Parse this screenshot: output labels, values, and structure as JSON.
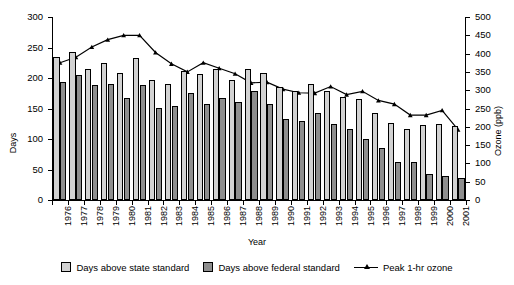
{
  "chart_data": {
    "type": "bar",
    "title": "",
    "xlabel": "Year",
    "ylabel": "Days",
    "ylabel_right": "Ozone (ppb)",
    "ylim": [
      0,
      300
    ],
    "ylim_right": [
      0,
      500
    ],
    "yticks": [
      0,
      50,
      100,
      150,
      200,
      250,
      300
    ],
    "yticks_right": [
      0,
      50,
      100,
      150,
      200,
      250,
      300,
      350,
      400,
      450,
      500
    ],
    "grid": false,
    "legend_position": "bottom",
    "categories": [
      "1976",
      "1977",
      "1978",
      "1979",
      "1980",
      "1981",
      "1982",
      "1983",
      "1984",
      "1985",
      "1986",
      "1987",
      "1988",
      "1989",
      "1990",
      "1991",
      "1992",
      "1993",
      "1994",
      "1995",
      "1996",
      "1997",
      "1998",
      "1999",
      "2000",
      "2001"
    ],
    "series": [
      {
        "name": "Days above state standard",
        "type": "bar",
        "color": "#d2d2d2",
        "axis": "left",
        "unit": "days",
        "values": [
          235,
          242,
          215,
          225,
          209,
          233,
          197,
          191,
          211,
          206,
          214,
          197,
          215,
          209,
          185,
          179,
          191,
          179,
          169,
          166,
          143,
          127,
          116,
          123,
          124,
          121
        ]
      },
      {
        "name": "Days above federal standard",
        "type": "bar",
        "color": "#8e8e8e",
        "axis": "left",
        "unit": "days",
        "values": [
          194,
          205,
          188,
          191,
          167,
          188,
          151,
          154,
          176,
          157,
          167,
          160,
          178,
          157,
          133,
          130,
          142,
          124,
          117,
          100,
          85,
          62,
          62,
          42,
          39,
          36
        ]
      },
      {
        "name": "Peak 1-hr ozone",
        "type": "line",
        "color": "#000000",
        "axis": "right",
        "unit": "ppb",
        "values": [
          375,
          390,
          418,
          438,
          450,
          450,
          403,
          372,
          350,
          375,
          360,
          345,
          320,
          322,
          303,
          293,
          292,
          310,
          288,
          297,
          272,
          262,
          232,
          232,
          245,
          192
        ]
      }
    ],
    "legend": [
      {
        "label": "Days above state standard",
        "marker": "swatch-light"
      },
      {
        "label": "Days above federal standard",
        "marker": "swatch-dark"
      },
      {
        "label": "Peak 1-hr ozone",
        "marker": "line-with-triangle"
      }
    ]
  }
}
